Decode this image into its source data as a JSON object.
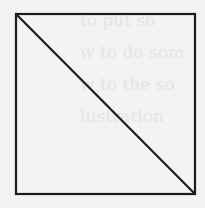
{
  "figure": {
    "type": "square-with-diagonal",
    "square": {
      "x": 16,
      "y": 14,
      "width": 179,
      "height": 180
    },
    "diagonal": {
      "from": "top-left",
      "to": "bottom-right"
    },
    "stroke_color": "#1c1c1c",
    "stroke_width": 2.2,
    "background_color": "#f3f3f1"
  },
  "bleed_through_text": {
    "lines": [
      "to put so",
      "w to do som",
      "w to the so",
      "lustration"
    ],
    "color": "#e4e4e2"
  }
}
